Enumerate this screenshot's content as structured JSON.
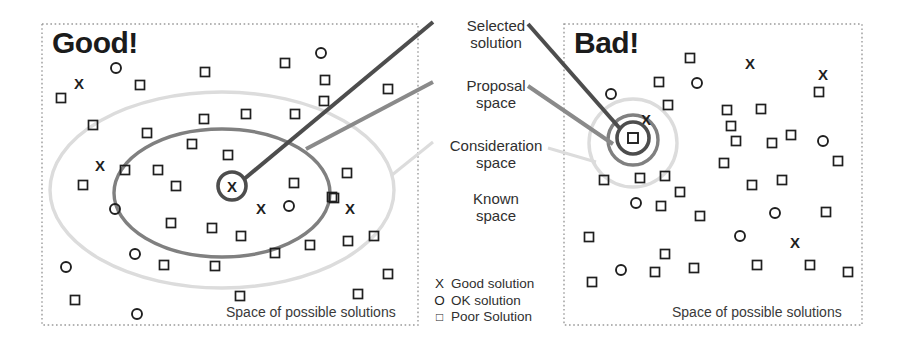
{
  "panels": {
    "left": {
      "title": "Good!",
      "caption": "Space of possible solutions",
      "box": {
        "x": 42,
        "y": 24,
        "w": 376,
        "h": 301
      },
      "known_space_shape": "dotted-rectangle",
      "consideration_ellipse": {
        "cx": 222,
        "cy": 190,
        "rx": 172,
        "ry": 98,
        "color": "#dcdcdc"
      },
      "proposal_ellipse": {
        "cx": 222,
        "cy": 193,
        "rx": 108,
        "ry": 64,
        "color": "#808080"
      },
      "selected": {
        "cx": 232,
        "cy": 186,
        "r": 14,
        "glyph": "X",
        "color": "#4d4d4d"
      },
      "markers": [
        {
          "t": "O",
          "x": 116,
          "y": 68
        },
        {
          "t": "S",
          "x": 140,
          "y": 85
        },
        {
          "t": "S",
          "x": 205,
          "y": 72
        },
        {
          "t": "S",
          "x": 285,
          "y": 63
        },
        {
          "t": "O",
          "x": 321,
          "y": 53
        },
        {
          "t": "S",
          "x": 325,
          "y": 80
        },
        {
          "t": "S",
          "x": 324,
          "y": 101
        },
        {
          "t": "S",
          "x": 388,
          "y": 89
        },
        {
          "t": "X",
          "x": 79,
          "y": 84
        },
        {
          "t": "S",
          "x": 61,
          "y": 98
        },
        {
          "t": "S",
          "x": 93,
          "y": 125
        },
        {
          "t": "S",
          "x": 147,
          "y": 133
        },
        {
          "t": "S",
          "x": 204,
          "y": 119
        },
        {
          "t": "S",
          "x": 246,
          "y": 114
        },
        {
          "t": "S",
          "x": 295,
          "y": 114
        },
        {
          "t": "S",
          "x": 192,
          "y": 144
        },
        {
          "t": "S",
          "x": 228,
          "y": 155
        },
        {
          "t": "S",
          "x": 158,
          "y": 170
        },
        {
          "t": "X",
          "x": 100,
          "y": 166
        },
        {
          "t": "S",
          "x": 125,
          "y": 170
        },
        {
          "t": "S",
          "x": 83,
          "y": 185
        },
        {
          "t": "O",
          "x": 115,
          "y": 209
        },
        {
          "t": "S",
          "x": 176,
          "y": 186
        },
        {
          "t": "S",
          "x": 294,
          "y": 183
        },
        {
          "t": "S",
          "x": 347,
          "y": 173
        },
        {
          "t": "X",
          "x": 261,
          "y": 209
        },
        {
          "t": "O",
          "x": 289,
          "y": 206
        },
        {
          "t": "S",
          "x": 334,
          "y": 198
        },
        {
          "t": "S",
          "x": 332,
          "y": 197
        },
        {
          "t": "X",
          "x": 350,
          "y": 209
        },
        {
          "t": "S",
          "x": 171,
          "y": 223
        },
        {
          "t": "S",
          "x": 212,
          "y": 228
        },
        {
          "t": "S",
          "x": 241,
          "y": 236
        },
        {
          "t": "S",
          "x": 310,
          "y": 245
        },
        {
          "t": "S",
          "x": 348,
          "y": 241
        },
        {
          "t": "S",
          "x": 374,
          "y": 236
        },
        {
          "t": "O",
          "x": 135,
          "y": 254
        },
        {
          "t": "S",
          "x": 164,
          "y": 265
        },
        {
          "t": "S",
          "x": 215,
          "y": 266
        },
        {
          "t": "S",
          "x": 275,
          "y": 253
        },
        {
          "t": "O",
          "x": 66,
          "y": 267
        },
        {
          "t": "S",
          "x": 388,
          "y": 274
        },
        {
          "t": "S",
          "x": 75,
          "y": 300
        },
        {
          "t": "S",
          "x": 240,
          "y": 296
        },
        {
          "t": "S",
          "x": 358,
          "y": 294
        },
        {
          "t": "O",
          "x": 137,
          "y": 314
        }
      ]
    },
    "right": {
      "title": "Bad!",
      "caption": "Space of possible solutions",
      "box": {
        "x": 564,
        "y": 24,
        "w": 298,
        "h": 301
      },
      "known_space_shape": "dotted-rectangle",
      "consideration_circle": {
        "cx": 633,
        "cy": 143,
        "r": 44,
        "color": "#dcdcdc"
      },
      "proposal_circle": {
        "cx": 633,
        "cy": 140,
        "r": 25,
        "color": "#808080"
      },
      "selected": {
        "cx": 633,
        "cy": 138,
        "r": 16,
        "glyph": "square",
        "color": "#4d4d4d"
      },
      "markers": [
        {
          "t": "S",
          "x": 690,
          "y": 58
        },
        {
          "t": "X",
          "x": 750,
          "y": 64
        },
        {
          "t": "X",
          "x": 823,
          "y": 75
        },
        {
          "t": "S",
          "x": 659,
          "y": 82
        },
        {
          "t": "O",
          "x": 697,
          "y": 83
        },
        {
          "t": "O",
          "x": 611,
          "y": 94
        },
        {
          "t": "S",
          "x": 819,
          "y": 92
        },
        {
          "t": "X",
          "x": 646,
          "y": 120
        },
        {
          "t": "S",
          "x": 668,
          "y": 105
        },
        {
          "t": "S",
          "x": 727,
          "y": 110
        },
        {
          "t": "S",
          "x": 761,
          "y": 109
        },
        {
          "t": "S",
          "x": 731,
          "y": 126
        },
        {
          "t": "S",
          "x": 791,
          "y": 135
        },
        {
          "t": "O",
          "x": 823,
          "y": 141
        },
        {
          "t": "S",
          "x": 736,
          "y": 141
        },
        {
          "t": "S",
          "x": 772,
          "y": 143
        },
        {
          "t": "S",
          "x": 724,
          "y": 163
        },
        {
          "t": "S",
          "x": 838,
          "y": 161
        },
        {
          "t": "S",
          "x": 604,
          "y": 180
        },
        {
          "t": "S",
          "x": 640,
          "y": 178
        },
        {
          "t": "S",
          "x": 665,
          "y": 176
        },
        {
          "t": "S",
          "x": 752,
          "y": 185
        },
        {
          "t": "S",
          "x": 782,
          "y": 180
        },
        {
          "t": "S",
          "x": 680,
          "y": 192
        },
        {
          "t": "O",
          "x": 636,
          "y": 203
        },
        {
          "t": "S",
          "x": 661,
          "y": 206
        },
        {
          "t": "S",
          "x": 700,
          "y": 216
        },
        {
          "t": "O",
          "x": 775,
          "y": 213
        },
        {
          "t": "S",
          "x": 826,
          "y": 212
        },
        {
          "t": "S",
          "x": 589,
          "y": 237
        },
        {
          "t": "O",
          "x": 740,
          "y": 236
        },
        {
          "t": "X",
          "x": 795,
          "y": 243
        },
        {
          "t": "S",
          "x": 665,
          "y": 254
        },
        {
          "t": "S",
          "x": 757,
          "y": 265
        },
        {
          "t": "S",
          "x": 810,
          "y": 265
        },
        {
          "t": "O",
          "x": 621,
          "y": 270
        },
        {
          "t": "S",
          "x": 655,
          "y": 272
        },
        {
          "t": "S",
          "x": 694,
          "y": 268
        },
        {
          "t": "S",
          "x": 848,
          "y": 272
        },
        {
          "t": "S",
          "x": 592,
          "y": 282
        }
      ]
    }
  },
  "labels": {
    "selected_solution": "Selected\nsolution",
    "proposal_space": "Proposal\nspace",
    "consideration_space": "Consideration\nspace",
    "known_space": "Known\nspace"
  },
  "connectors": [
    {
      "name": "selected-left",
      "x1": 433,
      "y1": 22,
      "x2": 243,
      "y2": 180,
      "color": "#4d4d4d",
      "width": 4
    },
    {
      "name": "selected-right",
      "x1": 528,
      "y1": 24,
      "x2": 623,
      "y2": 132,
      "color": "#4d4d4d",
      "width": 4
    },
    {
      "name": "proposal-left",
      "x1": 433,
      "y1": 82,
      "x2": 306,
      "y2": 149,
      "color": "#8a8a8a",
      "width": 4
    },
    {
      "name": "proposal-right",
      "x1": 528,
      "y1": 86,
      "x2": 613,
      "y2": 144,
      "color": "#8a8a8a",
      "width": 4
    },
    {
      "name": "consideration-left",
      "x1": 433,
      "y1": 142,
      "x2": 392,
      "y2": 175,
      "color": "#dcdcdc",
      "width": 3
    },
    {
      "name": "consideration-right",
      "x1": 548,
      "y1": 148,
      "x2": 596,
      "y2": 162,
      "color": "#dcdcdc",
      "width": 3
    }
  ],
  "legend": {
    "items": [
      {
        "glyph": "X",
        "label": "Good solution"
      },
      {
        "glyph": "O",
        "label": "OK solution"
      },
      {
        "glyph": "square",
        "label": "Poor Solution"
      }
    ]
  },
  "colors": {
    "selected": "#4d4d4d",
    "proposal": "#808080",
    "consideration": "#dcdcdc",
    "known_border": "#9a9a9a",
    "marker": "#1f1f1f",
    "text": "#2f2f2f"
  }
}
